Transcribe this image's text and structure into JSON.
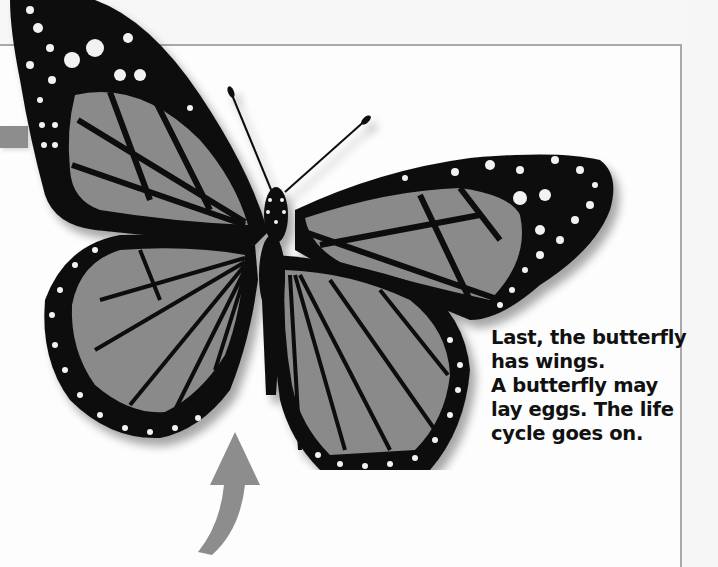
{
  "page": {
    "caption_lines": [
      "Last, the butterfly",
      "has wings.",
      "A butterfly may",
      "lay eggs. The life",
      "cycle goes on."
    ],
    "image": {
      "subject": "monarch-butterfly",
      "rendering": "grayscale"
    },
    "arrows": [
      {
        "name": "arrow-left",
        "direction": "right"
      },
      {
        "name": "arrow-bottom",
        "direction": "up"
      }
    ],
    "colors": {
      "frame": "#a9a9a9",
      "arrow": "#8d8d8d",
      "wing_fill": "#8a8a8a",
      "wing_border": "#0d0d0d",
      "text": "#111111"
    }
  }
}
